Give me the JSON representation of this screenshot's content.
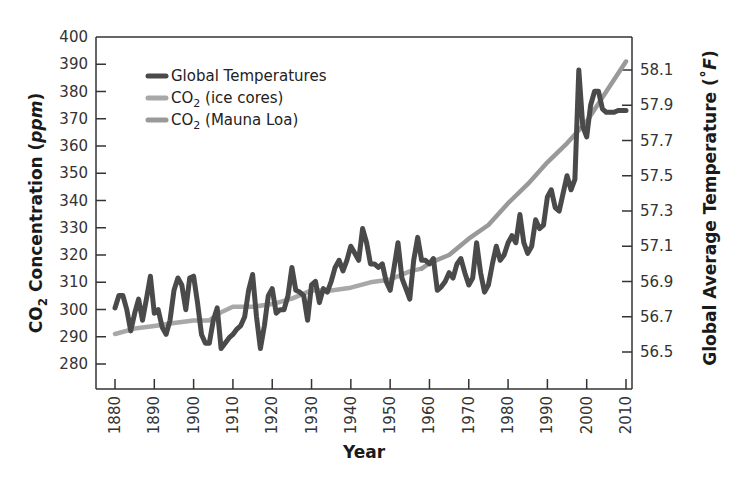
{
  "chart_data": {
    "type": "line",
    "title": "",
    "xlabel": "Year",
    "ylabel_left": "CO2 Concentration (ppm)",
    "ylabel_right": "Global Average Temperature (°F)",
    "xlim": [
      1880,
      2010
    ],
    "ylim_left": [
      270,
      400
    ],
    "ylim_right": [
      56.3,
      58.25
    ],
    "x_ticks": [
      1880,
      1890,
      1900,
      1910,
      1920,
      1930,
      1940,
      1950,
      1960,
      1970,
      1980,
      1990,
      2000,
      2010
    ],
    "y_left_ticks": [
      280,
      290,
      300,
      310,
      320,
      330,
      340,
      350,
      360,
      370,
      380,
      390,
      400
    ],
    "y_right_ticks": [
      56.5,
      56.7,
      56.9,
      57.1,
      57.3,
      57.5,
      57.7,
      57.9,
      58.1
    ],
    "grid": false,
    "legend_position": "upper-left",
    "series": [
      {
        "name": "Global Temperatures",
        "axis": "right",
        "color": "#4a4a4a",
        "x": [
          1880,
          1881,
          1882,
          1883,
          1884,
          1885,
          1886,
          1887,
          1888,
          1889,
          1890,
          1891,
          1892,
          1893,
          1894,
          1895,
          1896,
          1897,
          1898,
          1899,
          1900,
          1901,
          1902,
          1903,
          1904,
          1905,
          1906,
          1907,
          1908,
          1909,
          1910,
          1911,
          1912,
          1913,
          1914,
          1915,
          1916,
          1917,
          1918,
          1919,
          1920,
          1921,
          1922,
          1923,
          1924,
          1925,
          1926,
          1927,
          1928,
          1929,
          1930,
          1931,
          1932,
          1933,
          1934,
          1935,
          1936,
          1937,
          1938,
          1939,
          1940,
          1941,
          1942,
          1943,
          1944,
          1945,
          1946,
          1947,
          1948,
          1949,
          1950,
          1951,
          1952,
          1953,
          1954,
          1955,
          1956,
          1957,
          1958,
          1959,
          1960,
          1961,
          1962,
          1963,
          1964,
          1965,
          1966,
          1967,
          1968,
          1969,
          1970,
          1971,
          1972,
          1973,
          1974,
          1975,
          1976,
          1977,
          1978,
          1979,
          1980,
          1981,
          1982,
          1983,
          1984,
          1985,
          1986,
          1987,
          1988,
          1989,
          1990,
          1991,
          1992,
          1993,
          1994,
          1995,
          1996,
          1997,
          1998,
          1999,
          2000,
          2001,
          2002,
          2003,
          2004,
          2005,
          2006,
          2007,
          2008,
          2009,
          2010
        ],
        "values": [
          56.75,
          56.82,
          56.82,
          56.74,
          56.62,
          56.72,
          56.8,
          56.68,
          56.8,
          56.93,
          56.72,
          56.74,
          56.64,
          56.6,
          56.68,
          56.85,
          56.92,
          56.88,
          56.74,
          56.92,
          56.93,
          56.78,
          56.6,
          56.55,
          56.55,
          56.68,
          56.75,
          56.52,
          56.55,
          56.58,
          56.6,
          56.63,
          56.65,
          56.7,
          56.85,
          56.94,
          56.7,
          56.52,
          56.65,
          56.82,
          56.86,
          56.72,
          56.74,
          56.74,
          56.82,
          56.98,
          56.85,
          56.84,
          56.82,
          56.68,
          56.88,
          56.9,
          56.78,
          56.86,
          56.84,
          56.9,
          56.98,
          57.02,
          56.96,
          57.02,
          57.1,
          57.06,
          57.02,
          57.2,
          57.12,
          57.0,
          57.0,
          56.98,
          57.0,
          56.9,
          56.85,
          56.98,
          57.12,
          56.92,
          56.86,
          56.8,
          57.02,
          57.15,
          57.02,
          57.02,
          57.0,
          57.03,
          56.85,
          56.87,
          56.9,
          56.95,
          56.92,
          57.0,
          57.03,
          56.95,
          56.88,
          56.92,
          57.12,
          56.95,
          56.84,
          56.88,
          57.0,
          57.1,
          57.02,
          57.05,
          57.12,
          57.16,
          57.12,
          57.28,
          57.12,
          57.06,
          57.1,
          57.25,
          57.2,
          57.22,
          57.38,
          57.42,
          57.32,
          57.3,
          57.4,
          57.5,
          57.42,
          57.48,
          58.1,
          57.78,
          57.72,
          57.9,
          57.98,
          57.98,
          57.88,
          57.86,
          57.86,
          57.86,
          57.87,
          57.87,
          57.87
        ]
      },
      {
        "name": "CO2 (ice cores)",
        "axis": "left",
        "color": "#a8a8a8",
        "x": [
          1880,
          1885,
          1890,
          1895,
          1900,
          1904,
          1907,
          1910,
          1915,
          1920,
          1925,
          1930,
          1935,
          1940,
          1945,
          1950,
          1955,
          1958
        ],
        "values": [
          291,
          293,
          294,
          295,
          296,
          296,
          299,
          301,
          301,
          302,
          304,
          307,
          307,
          308,
          310,
          311,
          314,
          315
        ]
      },
      {
        "name": "CO2 (Mauna Loa)",
        "axis": "left",
        "color": "#999999",
        "x": [
          1958,
          1960,
          1965,
          1970,
          1975,
          1980,
          1985,
          1990,
          1995,
          2000,
          2005,
          2010
        ],
        "values": [
          315,
          317,
          320,
          326,
          331,
          339,
          346,
          354,
          361,
          369,
          380,
          391
        ]
      }
    ]
  },
  "axes": {
    "x_title": "Year",
    "left_title_prefix": "CO",
    "left_title_sub": "2",
    "left_title_mid": " Concentration (",
    "left_title_italic": "ppm",
    "left_title_end": ")",
    "right_title_main": "Global Average Temperature (",
    "right_title_deg": "˚",
    "right_title_italic": "F",
    "right_title_end": ")"
  },
  "legend": [
    {
      "label_prefix": "Global Temperatures",
      "label_sub": "",
      "label_suffix": "",
      "color": "#4a4a4a"
    },
    {
      "label_prefix": "CO",
      "label_sub": "2",
      "label_suffix": " (ice cores)",
      "color": "#a8a8a8"
    },
    {
      "label_prefix": "CO",
      "label_sub": "2",
      "label_suffix": " (Mauna Loa)",
      "color": "#999999"
    }
  ]
}
